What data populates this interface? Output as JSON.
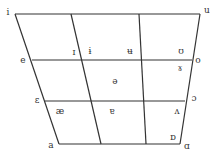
{
  "diagram": {
    "type": "vowel-trapezoid",
    "line_color": "#333333",
    "corners": {
      "top_left": [
        15,
        14
      ],
      "top_right": [
        200,
        14
      ],
      "bottom_left": [
        59,
        144
      ],
      "bottom_right": [
        180,
        144
      ]
    },
    "rows_y": [
      14,
      60,
      101,
      144
    ],
    "left_x": [
      15,
      32,
      45,
      59
    ],
    "right_x": [
      200,
      192,
      185,
      180
    ],
    "inner_left_x": [
      71,
      81,
      92,
      101
    ],
    "inner_right_x": [
      139,
      142,
      144,
      146
    ]
  },
  "vowels": [
    {
      "symbol": "i",
      "x": 8,
      "y": 12,
      "name": "vowel-i"
    },
    {
      "symbol": "u",
      "x": 207,
      "y": 10,
      "name": "vowel-u"
    },
    {
      "symbol": "e",
      "x": 23,
      "y": 60,
      "name": "vowel-e"
    },
    {
      "symbol": "o",
      "x": 198,
      "y": 60,
      "name": "vowel-o"
    },
    {
      "symbol": "ɛ",
      "x": 37,
      "y": 100,
      "name": "vowel-open-e"
    },
    {
      "symbol": "ɔ",
      "x": 194,
      "y": 98,
      "name": "vowel-open-o"
    },
    {
      "symbol": "a",
      "x": 51,
      "y": 145,
      "name": "vowel-a"
    },
    {
      "symbol": "ɑ",
      "x": 187,
      "y": 146,
      "name": "vowel-script-a"
    },
    {
      "symbol": "ɪ",
      "x": 74,
      "y": 52,
      "name": "vowel-small-cap-i"
    },
    {
      "symbol": "ɨ",
      "x": 90,
      "y": 51,
      "name": "vowel-barred-i"
    },
    {
      "symbol": "ʉ",
      "x": 130,
      "y": 51,
      "name": "vowel-barred-u"
    },
    {
      "symbol": "ʊ",
      "x": 181,
      "y": 51,
      "name": "vowel-upsilon"
    },
    {
      "symbol": "ɤ",
      "x": 180,
      "y": 68,
      "name": "vowel-rams-horn"
    },
    {
      "symbol": "ə",
      "x": 115,
      "y": 81,
      "name": "vowel-schwa"
    },
    {
      "symbol": "æ",
      "x": 60,
      "y": 111,
      "name": "vowel-ash"
    },
    {
      "symbol": "ɐ",
      "x": 112,
      "y": 111,
      "name": "vowel-turned-a"
    },
    {
      "symbol": "ʌ",
      "x": 177,
      "y": 111,
      "name": "vowel-turned-v"
    },
    {
      "symbol": "ɒ",
      "x": 173,
      "y": 137,
      "name": "vowel-turned-script-a"
    }
  ]
}
